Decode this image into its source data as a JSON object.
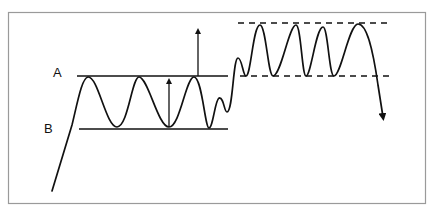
{
  "diagram": {
    "type": "price-pattern",
    "labels": {
      "a": "A",
      "b": "B"
    },
    "colors": {
      "line": "#111111",
      "frame": "#9a9a9a",
      "background": "#ffffff"
    },
    "elements": {
      "level_a": {
        "name": "resistance-line-a",
        "y": 76,
        "x1": 77,
        "x2": 228,
        "style": "solid"
      },
      "level_b": {
        "name": "support-line-b",
        "y": 129,
        "x1": 79,
        "x2": 228,
        "style": "solid"
      },
      "upper_dashed": {
        "name": "upper-dashed-line",
        "y": 23,
        "x1": 238,
        "x2": 388,
        "style": "dashed"
      },
      "lower_dashed": {
        "name": "lower-dashed-line",
        "y": 76,
        "x1": 240,
        "x2": 390,
        "style": "dashed"
      },
      "range_arrow": {
        "name": "range-height-arrow",
        "x": 169,
        "y_from": 127,
        "y_to": 77
      },
      "target_arrow": {
        "name": "breakout-target-arrow",
        "x": 198,
        "y_from": 76,
        "y_to": 28
      },
      "breakdown_arrow_tip": {
        "x": 384,
        "y": 121
      }
    }
  }
}
